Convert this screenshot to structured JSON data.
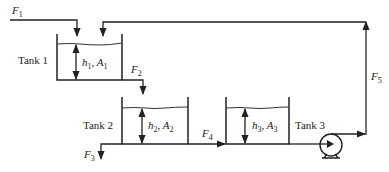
{
  "diagram": {
    "tanks": [
      {
        "label": "Tank 1",
        "height_var": "h",
        "area_var": "A",
        "index": "1"
      },
      {
        "label": "Tank 2",
        "height_var": "h",
        "area_var": "A",
        "index": "2"
      },
      {
        "label": "Tank 3",
        "height_var": "h",
        "area_var": "A",
        "index": "3"
      }
    ],
    "flows": [
      {
        "var": "F",
        "index": "1",
        "desc": "feed into Tank 1"
      },
      {
        "var": "F",
        "index": "2",
        "desc": "Tank 1 outflow into Tank 2"
      },
      {
        "var": "F",
        "index": "3",
        "desc": "withdrawal from Tank 2 line"
      },
      {
        "var": "F",
        "index": "4",
        "desc": "Tank 2 to Tank 3"
      },
      {
        "var": "F",
        "index": "5",
        "desc": "pumped recycle from Tank 3 to Tank 1"
      }
    ],
    "components": {
      "pump": "pump-icon"
    },
    "separator": ", "
  }
}
